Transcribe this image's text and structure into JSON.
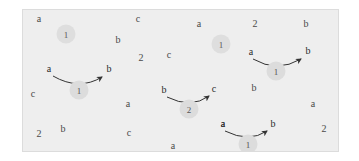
{
  "canvas": {
    "width": 359,
    "height": 161,
    "background": "#ffffff"
  },
  "panel": {
    "background": "#eeeeee",
    "border_color": "#dcdcdc",
    "x": 22,
    "y": 9,
    "width": 315,
    "height": 141
  },
  "colors": {
    "panel_bg": "#eeeeee",
    "token_text": "#4a4a4a",
    "endpoint_text": "#2b2b2b",
    "badge_bg": "#dcdcdc",
    "badge_text": "#555555",
    "arrow_stroke": "#333333"
  },
  "scatter_tokens": [
    {
      "label": "a",
      "x": 38,
      "y": 18
    },
    {
      "label": "c",
      "x": 137,
      "y": 18
    },
    {
      "label": "a",
      "x": 198,
      "y": 23
    },
    {
      "label": "2",
      "x": 254,
      "y": 23
    },
    {
      "label": "b",
      "x": 305,
      "y": 23
    },
    {
      "label": "b",
      "x": 117,
      "y": 39
    },
    {
      "label": "2",
      "x": 140,
      "y": 57
    },
    {
      "label": "c",
      "x": 168,
      "y": 54
    },
    {
      "label": "c",
      "x": 32,
      "y": 93
    },
    {
      "label": "b",
      "x": 253,
      "y": 87
    },
    {
      "label": "a",
      "x": 127,
      "y": 103
    },
    {
      "label": "a",
      "x": 222,
      "y": 123
    },
    {
      "label": "a",
      "x": 312,
      "y": 103
    },
    {
      "label": "b",
      "x": 62,
      "y": 128
    },
    {
      "label": "2",
      "x": 38,
      "y": 133
    },
    {
      "label": "c",
      "x": 128,
      "y": 132
    },
    {
      "label": "a",
      "x": 172,
      "y": 145
    },
    {
      "label": "2",
      "x": 323,
      "y": 128
    }
  ],
  "scatter_badges": [
    {
      "label": "1",
      "x": 65,
      "y": 33
    },
    {
      "label": "1",
      "x": 220,
      "y": 43
    }
  ],
  "arrows": [
    {
      "id": "arrow-a-to-b-1",
      "source": "a",
      "target": "b",
      "label": "1",
      "source_x": 48,
      "source_y": 68,
      "target_x": 108,
      "target_y": 68,
      "badge_x": 78,
      "badge_y": 89,
      "path": "M 52 75 Q 78 90 101 76"
    },
    {
      "id": "arrow-b-to-c-2",
      "source": "b",
      "target": "c",
      "label": "2",
      "source_x": 163,
      "source_y": 89,
      "target_x": 213,
      "target_y": 88,
      "badge_x": 188,
      "badge_y": 108,
      "path": "M 166 96 Q 190 108 208 95"
    },
    {
      "id": "arrow-a-to-b-2",
      "source": "a",
      "target": "b",
      "label": "1",
      "source_x": 250,
      "source_y": 51,
      "target_x": 307,
      "target_y": 50,
      "badge_x": 275,
      "badge_y": 70,
      "path": "M 252 58 Q 276 72 300 58"
    },
    {
      "id": "arrow-a-to-b-3",
      "source": "a",
      "target": "b",
      "label": "1",
      "source_x": 222,
      "source_y": 123,
      "target_x": 272,
      "target_y": 123,
      "badge_x": 247,
      "badge_y": 143,
      "path": "M 224 130 Q 248 142 266 130"
    }
  ]
}
